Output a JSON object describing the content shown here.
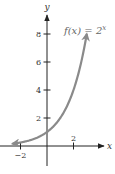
{
  "chart_data": {
    "type": "line",
    "title": "",
    "function": "2^x",
    "annotation": "f(x) = 2",
    "annotation_exponent": "x",
    "xlabel": "x",
    "ylabel": "y",
    "xlim": [
      -2.5,
      4.5
    ],
    "ylim": [
      -2.5,
      10
    ],
    "xticks": [
      {
        "value": -2,
        "label": "−2"
      },
      {
        "value": 2,
        "label": "2"
      }
    ],
    "yticks": [
      {
        "value": 2,
        "label": "2"
      },
      {
        "value": 4,
        "label": "4"
      },
      {
        "value": 6,
        "label": "6"
      },
      {
        "value": 8,
        "label": "8"
      }
    ],
    "series": [
      {
        "name": "f(x) = 2^x",
        "color": "#8a8a8a",
        "x": [
          -2,
          -1.5,
          -1,
          -0.5,
          0,
          0.5,
          1,
          1.5,
          2,
          2.5,
          3
        ],
        "y": [
          0.25,
          0.354,
          0.5,
          0.707,
          1,
          1.414,
          2,
          2.828,
          4,
          5.657,
          8
        ],
        "arrows": "both"
      }
    ],
    "grid": false,
    "legend": "none"
  }
}
